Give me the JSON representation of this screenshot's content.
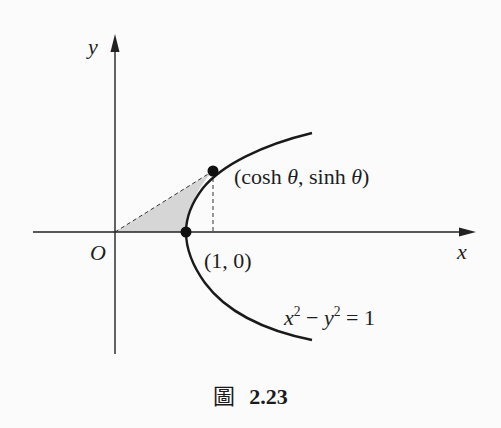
{
  "figure": {
    "axes": {
      "x_label": "x",
      "y_label": "y",
      "origin_label": "O"
    },
    "curve": {
      "equation_lhs_x": "x",
      "equation_sup_x": "2",
      "equation_minus": " − ",
      "equation_lhs_y": "y",
      "equation_sup_y": "2",
      "equation_rhs": " = 1",
      "full_equation": "x² − y² = 1"
    },
    "points": {
      "vertex_label": "(1, 0)",
      "param_label_open": "(cosh ",
      "param_theta1": "θ",
      "param_mid": ", sinh ",
      "param_theta2": "θ",
      "param_close": ")",
      "param_full": "(cosh θ, sinh θ)"
    },
    "shaded_region": "area between segment from O to (cosh θ, sinh θ), x-axis, and hyperbola",
    "colors": {
      "curve": "#1a1a1a",
      "shade": "#d4d4d4",
      "background": "#fbfbfb"
    }
  },
  "caption": {
    "prefix": "圖",
    "number": "2.23"
  }
}
